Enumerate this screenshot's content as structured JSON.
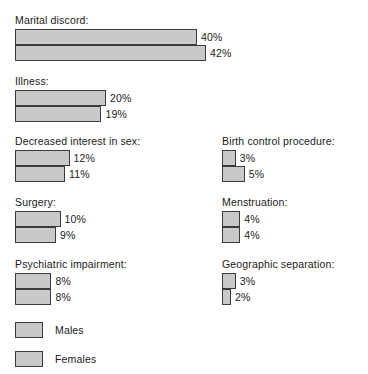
{
  "chart_data": {
    "type": "bar",
    "orientation": "horizontal",
    "title": "",
    "xlabel": "",
    "ylabel": "",
    "grid": false,
    "unit": "%",
    "xlim": [
      0,
      45
    ],
    "legend_position": "bottom-left",
    "series": [
      {
        "name": "Males",
        "values": [
          40,
          20,
          12,
          10,
          8,
          3,
          4,
          3
        ]
      },
      {
        "name": "Females",
        "values": [
          42,
          19,
          11,
          9,
          8,
          5,
          4,
          2
        ]
      }
    ],
    "categories": [
      "Marital discord:",
      "Illness:",
      "Decreased interest in sex:",
      "Surgery:",
      "Psychiatric impairment:",
      "Birth control procedure:",
      "Menstruation:",
      "Geographic separation:"
    ]
  },
  "legend": {
    "entries": [
      {
        "label": "Males"
      },
      {
        "label": "Females"
      }
    ]
  },
  "groups": {
    "left": [
      {
        "label": "Marital discord:",
        "males": {
          "value": 40,
          "value_label": "40%"
        },
        "females": {
          "value": 42,
          "value_label": "42%"
        }
      },
      {
        "label": "Illness:",
        "males": {
          "value": 20,
          "value_label": "20%"
        },
        "females": {
          "value": 19,
          "value_label": "19%"
        }
      },
      {
        "label": "Decreased interest in sex:",
        "males": {
          "value": 12,
          "value_label": "12%"
        },
        "females": {
          "value": 11,
          "value_label": "11%"
        }
      },
      {
        "label": "Surgery:",
        "males": {
          "value": 10,
          "value_label": "10%"
        },
        "females": {
          "value": 9,
          "value_label": "9%"
        }
      },
      {
        "label": "Psychiatric impairment:",
        "males": {
          "value": 8,
          "value_label": "8%"
        },
        "females": {
          "value": 8,
          "value_label": "8%"
        }
      }
    ],
    "right": [
      {
        "label": "Birth control procedure:",
        "males": {
          "value": 3,
          "value_label": "3%"
        },
        "females": {
          "value": 5,
          "value_label": "5%"
        }
      },
      {
        "label": "Menstruation:",
        "males": {
          "value": 4,
          "value_label": "4%"
        },
        "females": {
          "value": 4,
          "value_label": "4%"
        }
      },
      {
        "label": "Geographic separation:",
        "males": {
          "value": 3,
          "value_label": "3%"
        },
        "females": {
          "value": 2,
          "value_label": "2%"
        }
      }
    ]
  },
  "style": {
    "bar_fill": "#c9c9c9",
    "bar_border": "#3b3b3b",
    "text_color": "#1a1a1a",
    "background": "#ffffff",
    "px_per_percent": 4.55
  }
}
